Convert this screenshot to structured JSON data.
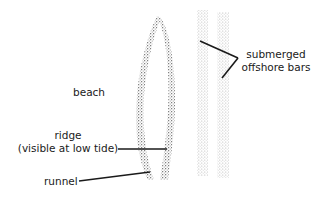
{
  "diagram": {
    "type": "coastal cross-section plan view",
    "labels": {
      "beach": "beach",
      "ridge_line1": "ridge",
      "ridge_line2": "(visible at low tide)",
      "runnel": "runnel",
      "bars_line1": "submerged",
      "bars_line2": "offshore bars"
    },
    "features": [
      {
        "name": "ridge",
        "shape": "curved stippled band"
      },
      {
        "name": "runnel",
        "shape": "gap inside ridge loop"
      },
      {
        "name": "offshore bar 1",
        "shape": "vertical stippled band"
      },
      {
        "name": "offshore bar 2",
        "shape": "vertical stippled band"
      }
    ],
    "colors": {
      "ink": "#1a1a1a",
      "stipple_dark": "#555555",
      "stipple_light": "#9a9a9a"
    }
  }
}
